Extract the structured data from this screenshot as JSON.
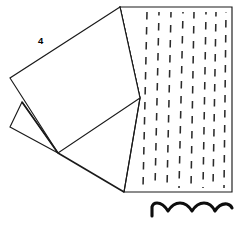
{
  "figure": {
    "background_color": "#ffffff",
    "line_color": "#1a1a1a",
    "dash_color": "#2b2b2b",
    "wave_color": "#0d0d0d",
    "width": 245,
    "height": 227
  },
  "labels": [
    {
      "id": "ref-4",
      "text": "4",
      "x": 38,
      "y": 44
    }
  ],
  "shapes": {
    "upper_flap": {
      "name": "upper-folded-flap",
      "points": "120,7 10,78 58,153 140,98"
    },
    "lower_flap": {
      "name": "lower-folded-flap",
      "points": "22,102 10,127 58,153"
    },
    "stitched_panel": {
      "name": "stitched-panel",
      "points": "120,7 232,7 232,192 124,192 140,98"
    },
    "crease_upper": {
      "name": "crease-line-upper",
      "path": "M 22,102 L 58,153"
    },
    "crease_lower": {
      "name": "crease-line-lower",
      "path": "M 58,153 L 124,192"
    },
    "panel_left_edge": {
      "name": "panel-left-edge",
      "path": "M 120,7 L 140,98 L 124,192"
    }
  },
  "stitch_rows": {
    "name": "vertical-dashed-stitch-lines",
    "count": 8,
    "dash_pattern": "7.5 7.5",
    "columns": [
      {
        "x_top": 147,
        "x_bottom": 143,
        "y_top": 12,
        "y_bottom": 188
      },
      {
        "x_top": 159,
        "x_bottom": 155,
        "y_top": 12,
        "y_bottom": 188
      },
      {
        "x_top": 171,
        "x_bottom": 167,
        "y_top": 12,
        "y_bottom": 188
      },
      {
        "x_top": 183,
        "x_bottom": 179,
        "y_top": 12,
        "y_bottom": 188
      },
      {
        "x_top": 194,
        "x_bottom": 191,
        "y_top": 12,
        "y_bottom": 188
      },
      {
        "x_top": 206,
        "x_bottom": 203,
        "y_top": 12,
        "y_bottom": 188
      },
      {
        "x_top": 216,
        "x_bottom": 213,
        "y_top": 12,
        "y_bottom": 188
      },
      {
        "x_top": 226,
        "x_bottom": 224,
        "y_top": 12,
        "y_bottom": 188
      }
    ],
    "phase_offsets": [
      0,
      4,
      2,
      6,
      1,
      5,
      3,
      7
    ]
  },
  "wave": {
    "name": "scalloped-wave-detail",
    "arch_count": 4,
    "path": "M 152,216 L 152,207 Q 153,203 157,203 Q 163,203 168,211 Q 173,203 180,203 Q 187,203 192,211 Q 197,203 204,203 Q 211,203 215,211 Q 220,203 227,204 Q 231,205 232,208"
  }
}
